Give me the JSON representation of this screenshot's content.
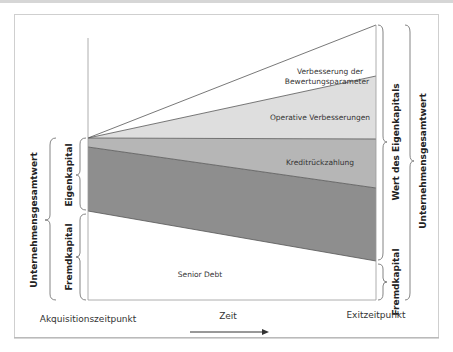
{
  "diagram": {
    "segments": {
      "valuation": "Verbesserung der",
      "valuation_line2": "Bewertungsparameter",
      "operative": "Operative Verbesserungen",
      "debt_repayment": "Kreditrückzahlung",
      "senior_debt": "Senior Debt"
    },
    "left_braces": {
      "enterprise_value": "Unternehmensgesamtwert",
      "equity": "Eigenkapital",
      "debt": "Fremdkapital"
    },
    "right_braces": {
      "equity_value": "Wert des Eigenkapitals",
      "debt": "Fremdkapital",
      "enterprise_value": "Unternehmensgesamtwert"
    },
    "axis": {
      "start_label": "Akquisitionszeitpunkt",
      "time_label": "Zeit",
      "end_label": "Exitzeitpunkt"
    },
    "colors": {
      "valuation_fill": "#ffffff",
      "operative_fill": "#dcdcdc",
      "debt_repayment_fill": "#b4b4b4",
      "equity_fill": "#8c8c8c",
      "senior_debt_fill": "#ffffff",
      "line": "#555555"
    }
  }
}
